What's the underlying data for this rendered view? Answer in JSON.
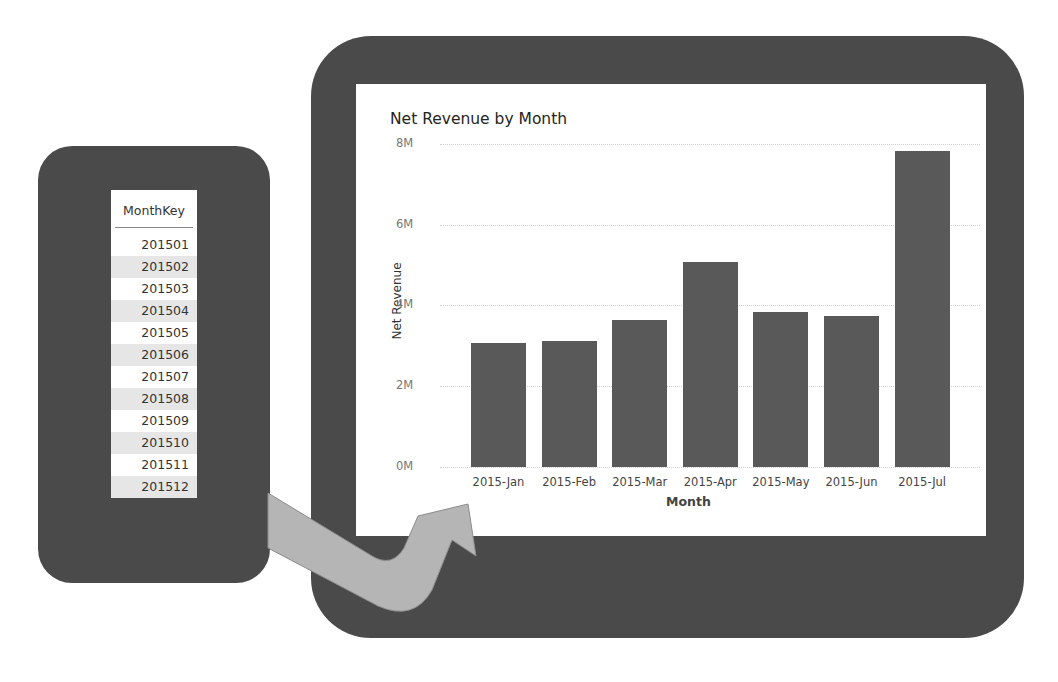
{
  "table": {
    "header": "MonthKey",
    "rows": [
      "201501",
      "201502",
      "201503",
      "201504",
      "201505",
      "201506",
      "201507",
      "201508",
      "201509",
      "201510",
      "201511",
      "201512"
    ]
  },
  "chart_data": {
    "type": "bar",
    "title": "Net Revenue by Month",
    "xlabel": "Month",
    "ylabel": "Net Revenue",
    "categories": [
      "2015-Jan",
      "2015-Feb",
      "2015-Mar",
      "2015-Apr",
      "2015-May",
      "2015-Jun",
      "2015-Jul"
    ],
    "values": [
      3.07,
      3.13,
      3.63,
      5.08,
      3.84,
      3.74,
      7.82
    ],
    "value_unit": "M",
    "yticks": [
      "0M",
      "2M",
      "4M",
      "6M",
      "8M"
    ],
    "ylim": [
      0,
      8
    ],
    "grid": true,
    "legend": "none",
    "bar_color": "#595959"
  },
  "colors": {
    "frame": "#4a4a4a",
    "arrow": "#b5b5b5",
    "alt_row": "#e6e6e6"
  }
}
